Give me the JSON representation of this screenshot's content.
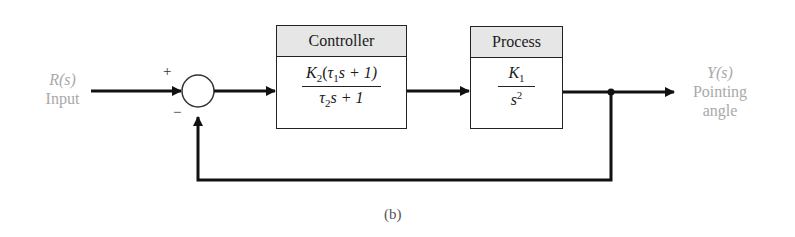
{
  "diagram": {
    "type": "feedback-block-diagram",
    "input": {
      "symbol": "R(s)",
      "label": "Input"
    },
    "output": {
      "symbol": "Y(s)",
      "label_line1": "Pointing",
      "label_line2": "angle"
    },
    "summing_junction": {
      "plus_sign": "+",
      "minus_sign": "−"
    },
    "controller": {
      "title": "Controller",
      "numerator_gain": "K",
      "numerator_gain_sub": "2",
      "numerator_open": "(",
      "tau": "τ",
      "tau1_sub": "1",
      "numerator_rest": "s + 1)",
      "denominator_tau_sub": "2",
      "denominator_rest": "s + 1"
    },
    "process": {
      "title": "Process",
      "numerator": "K",
      "numerator_sub": "1",
      "denominator": "s",
      "denominator_sup": "2"
    },
    "caption": "(b)"
  },
  "colors": {
    "line": "#111111",
    "label_gray": "#a9a9a9",
    "header_fill": "#e6e6e6"
  }
}
